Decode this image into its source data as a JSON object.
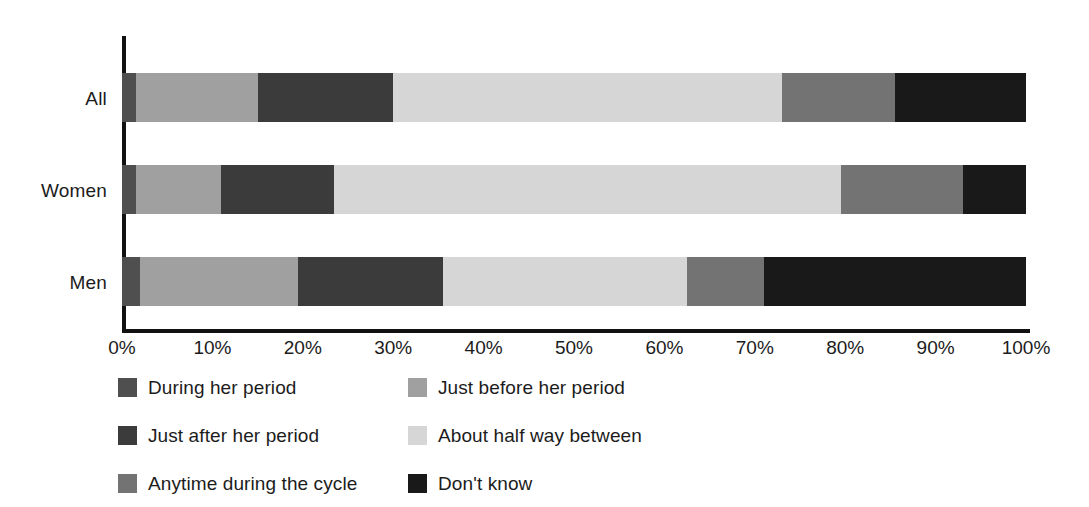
{
  "chart_data": {
    "type": "bar",
    "orientation": "horizontal",
    "stacked": true,
    "stack_mode": "percent",
    "title": "",
    "subtitle": "",
    "xlabel": "",
    "ylabel": "",
    "xlim": [
      0,
      100
    ],
    "grid": false,
    "legend_position": "bottom",
    "categories": [
      "All",
      "Women",
      "Men"
    ],
    "tick_labels": [
      "0%",
      "10%",
      "20%",
      "30%",
      "40%",
      "50%",
      "60%",
      "70%",
      "80%",
      "90%",
      "100%"
    ],
    "tick_values": [
      0,
      10,
      20,
      30,
      40,
      50,
      60,
      70,
      80,
      90,
      100
    ],
    "series": [
      {
        "name": "During her period",
        "color": "#4f4f4f",
        "values": [
          1.5,
          1.5,
          2
        ]
      },
      {
        "name": "Just before her period",
        "color": "#a0a0a0",
        "values": [
          13.5,
          9.5,
          17.5
        ]
      },
      {
        "name": "Just after her period",
        "color": "#3b3b3b",
        "values": [
          15,
          12.5,
          16
        ]
      },
      {
        "name": "About half way between",
        "color": "#d6d6d6",
        "values": [
          43,
          56,
          27
        ]
      },
      {
        "name": "Anytime during the cycle",
        "color": "#737373",
        "values": [
          12.5,
          13.5,
          8.5
        ]
      },
      {
        "name": "Don't know",
        "color": "#191919",
        "values": [
          14.5,
          7,
          29
        ]
      }
    ],
    "legend": [
      {
        "label": "During her period",
        "color": "#4f4f4f"
      },
      {
        "label": "Just before her period",
        "color": "#a0a0a0"
      },
      {
        "label": "Just after her period",
        "color": "#3b3b3b"
      },
      {
        "label": "About half way between",
        "color": "#d6d6d6"
      },
      {
        "label": "Anytime during the cycle",
        "color": "#737373"
      },
      {
        "label": "Don't know",
        "color": "#191919"
      }
    ],
    "axis_color": "#111111",
    "background": "#ffffff"
  }
}
